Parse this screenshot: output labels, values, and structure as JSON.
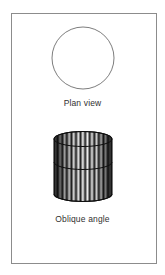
{
  "page": {
    "background_color": "#ffffff",
    "frame_color": "#8c8c8c",
    "ink_color": "#1a1a1a",
    "caption_color": "#303030"
  },
  "figure": {
    "panels": [
      {
        "id": "plan-view",
        "shape": "circle",
        "caption": "Plan view",
        "line_color": "#6e6e6e",
        "fill": "none",
        "geometry": {
          "cx": 82.5,
          "cy": 68,
          "r": 31
        }
      },
      {
        "id": "oblique-angle",
        "shape": "cylinder",
        "caption": "Oblique angle",
        "line_color": "#1a1a1a",
        "hatching": "vertical-lines",
        "hatch_count": 46,
        "geometry": {
          "left": 55,
          "right": 113,
          "top": 136,
          "bottom": 205,
          "ellipse_ry": 7,
          "mid_arc_y": 167
        }
      }
    ]
  },
  "captions": {
    "plan_view": "Plan view",
    "oblique_angle": "Oblique angle"
  },
  "icons": {
    "circle": "circle-outline-icon",
    "cylinder": "cylinder-icon"
  }
}
